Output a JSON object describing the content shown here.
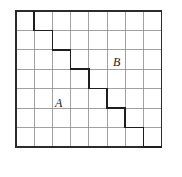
{
  "figure": {
    "background_color": "#ffffff"
  },
  "grid": {
    "columns": 8,
    "rows": 7,
    "origin_x": 16,
    "origin_y": 11,
    "cell_width": 18.2,
    "cell_height": 19.4,
    "inner_line_color": "#8a8a8a",
    "inner_line_width": 0.8,
    "border_color": "#2b2b2b",
    "border_width": 1.4
  },
  "staircase": {
    "name": "staircase-boundary",
    "color": "#1e1e1e",
    "width": 1.5,
    "description": "Monotone staircase from top edge to right edge separating region A from region B",
    "vertices": [
      [
        1,
        0
      ],
      [
        1,
        1
      ],
      [
        2,
        1
      ],
      [
        2,
        2
      ],
      [
        3,
        2
      ],
      [
        3,
        3
      ],
      [
        4,
        3
      ],
      [
        4,
        4
      ],
      [
        5,
        4
      ],
      [
        5,
        5
      ],
      [
        6,
        5
      ],
      [
        6,
        6
      ],
      [
        7,
        6
      ],
      [
        7,
        7
      ],
      [
        8,
        7
      ]
    ]
  },
  "labels": {
    "region_a": "A",
    "region_b": "B"
  }
}
